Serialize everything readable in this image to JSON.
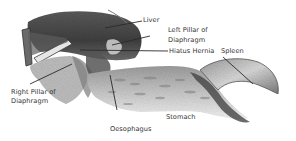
{
  "diagram": {
    "style": "grayscale pencil drawing",
    "colors": {
      "background": "#ffffff",
      "ink": "#333333",
      "shade_dark": "#4a4a4a",
      "shade_mid": "#8a8a8a",
      "shade_light": "#c8c8c8"
    },
    "labels": {
      "liver": "Liver",
      "left_pillar_line1": "Left Pillar of",
      "left_pillar_line2": "Diaphragm",
      "hiatus_hernia": "Hiatus Hernia",
      "spleen": "Spleen",
      "right_pillar_line1": "Right Pillar of",
      "right_pillar_line2": "Diaphragm",
      "oesophagus": "Oesophagus",
      "stomach": "Stomach"
    }
  }
}
